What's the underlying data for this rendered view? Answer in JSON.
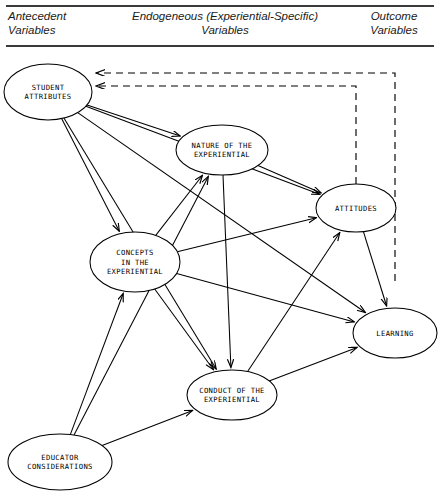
{
  "header": {
    "columns": [
      {
        "id": "antecedent",
        "label": "Antecedent\nVariables"
      },
      {
        "id": "endogeneous",
        "label": "Endogeneous (Experiential-Specific)\nVariables"
      },
      {
        "id": "outcome",
        "label": "Outcome\nVariables"
      }
    ]
  },
  "diagram": {
    "type": "path-diagram",
    "nodes": [
      {
        "id": "student-attributes",
        "label": "STUDENT\nATTRIBUTES",
        "lines": [
          "STUDENT",
          "ATTRIBUTES"
        ],
        "cx": 48,
        "cy": 40,
        "rx": 44,
        "ry": 28,
        "column": "antecedent"
      },
      {
        "id": "nature",
        "label": "NATURE OF THE\nEXPERIENTIAL",
        "lines": [
          "NATURE OF THE",
          "EXPERIENTIAL"
        ],
        "cx": 222,
        "cy": 98,
        "rx": 46,
        "ry": 25,
        "column": "endogeneous"
      },
      {
        "id": "attitudes",
        "label": "ATTITUDES",
        "lines": [
          "ATTITUDES"
        ],
        "cx": 356,
        "cy": 156,
        "rx": 40,
        "ry": 24,
        "column": "endogeneous"
      },
      {
        "id": "concepts",
        "label": "CONCEPTS\nIN THE\nEXPERIENTIAL",
        "lines": [
          "CONCEPTS",
          "IN THE",
          "EXPERIENTIAL"
        ],
        "cx": 135,
        "cy": 210,
        "rx": 45,
        "ry": 30,
        "column": "endogeneous"
      },
      {
        "id": "learning",
        "label": "LEARNING",
        "lines": [
          "LEARNING"
        ],
        "cx": 395,
        "cy": 281,
        "rx": 42,
        "ry": 25,
        "column": "outcome"
      },
      {
        "id": "conduct",
        "label": "CONDUCT OF THE\nEXPERIENTIAL",
        "lines": [
          "CONDUCT OF THE",
          "EXPERIENTIAL"
        ],
        "cx": 232,
        "cy": 343,
        "rx": 45,
        "ry": 25,
        "column": "endogeneous"
      },
      {
        "id": "educator",
        "label": "EDUCATOR\nCONSIDERATIONS",
        "lines": [
          "EDUCATOR",
          "CONSIDERATIONS"
        ],
        "cx": 60,
        "cy": 410,
        "rx": 52,
        "ry": 28,
        "column": "antecedent"
      }
    ],
    "edges": [
      {
        "id": "sa-nature",
        "from": "student-attributes",
        "to": "nature",
        "style": "solid"
      },
      {
        "id": "sa-concepts",
        "from": "student-attributes",
        "to": "concepts",
        "style": "solid"
      },
      {
        "id": "sa-conduct",
        "from": "student-attributes",
        "to": "conduct",
        "style": "solid"
      },
      {
        "id": "sa-attitudes",
        "from": "student-attributes",
        "to": "attitudes",
        "style": "solid"
      },
      {
        "id": "sa-learning",
        "from": "student-attributes",
        "to": "learning",
        "style": "solid"
      },
      {
        "id": "nature-attitudes",
        "from": "nature",
        "to": "attitudes",
        "style": "solid"
      },
      {
        "id": "nature-conduct",
        "from": "nature",
        "to": "conduct",
        "style": "solid"
      },
      {
        "id": "concepts-nature",
        "from": "concepts",
        "to": "nature",
        "style": "solid"
      },
      {
        "id": "concepts-attitudes",
        "from": "concepts",
        "to": "attitudes",
        "style": "solid"
      },
      {
        "id": "concepts-learning",
        "from": "concepts",
        "to": "learning",
        "style": "solid"
      },
      {
        "id": "concepts-conduct",
        "from": "concepts",
        "to": "conduct",
        "style": "solid"
      },
      {
        "id": "conduct-attitudes",
        "from": "conduct",
        "to": "attitudes",
        "style": "solid"
      },
      {
        "id": "conduct-learning",
        "from": "conduct",
        "to": "learning",
        "style": "solid"
      },
      {
        "id": "attitudes-learning",
        "from": "attitudes",
        "to": "learning",
        "style": "solid"
      },
      {
        "id": "educator-concepts",
        "from": "educator",
        "to": "concepts",
        "style": "solid"
      },
      {
        "id": "educator-nature",
        "from": "educator",
        "to": "nature",
        "style": "solid"
      },
      {
        "id": "educator-conduct",
        "from": "educator",
        "to": "conduct",
        "style": "solid"
      },
      {
        "id": "learning-feedback",
        "from": "learning",
        "to": "student-attributes",
        "style": "dashed"
      },
      {
        "id": "attitudes-feedback",
        "from": "attitudes",
        "to": "student-attributes",
        "style": "dashed"
      }
    ]
  },
  "colors": {
    "stroke": "#000000",
    "background": "#ffffff",
    "rule": "#3a3a3a"
  }
}
